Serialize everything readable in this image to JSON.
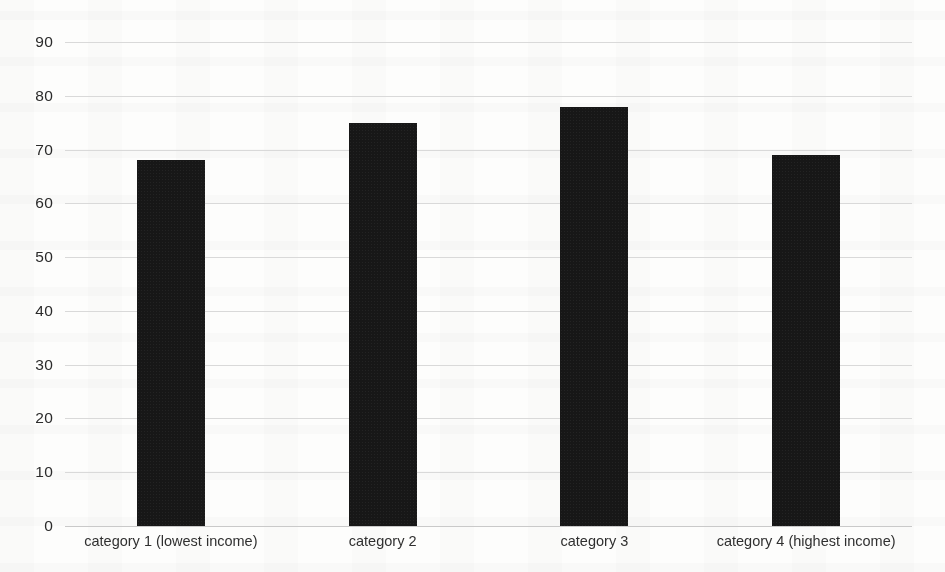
{
  "chart_data": {
    "type": "bar",
    "title": "",
    "subtitle": "",
    "xlabel": "",
    "ylabel": "",
    "categories": [
      "category 1 (lowest income)",
      "category 2",
      "category 3",
      "category 4 (highest income)"
    ],
    "values": [
      68,
      75,
      78,
      69
    ],
    "ylim": [
      0,
      90
    ],
    "ytick_labels": [
      "90",
      "80",
      "70",
      "60",
      "50",
      "40",
      "30",
      "20",
      "10",
      "0"
    ],
    "ytick_values": [
      90,
      80,
      70,
      60,
      50,
      40,
      30,
      20,
      10,
      0
    ],
    "ytick_step": 10,
    "grid": true,
    "grid_axis": "y",
    "legend": false,
    "legend_position": "none",
    "bar_color": "#171717",
    "grid_color": "#d9d9d9",
    "background_color": "#fdfdfc",
    "tick_label_color": "#2b2b2b",
    "axis_label_color": "#303030"
  }
}
